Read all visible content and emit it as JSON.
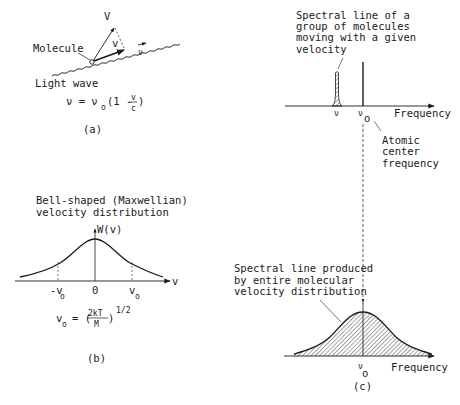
{
  "panel_a": {
    "caption": "(a)",
    "labels": {
      "velocity_vector": "V",
      "velocity_component": "v",
      "wave_frequency": "ν",
      "molecule": "Molecule",
      "light_wave": "Light wave"
    },
    "formula": {
      "lhs": "ν = ν",
      "sub": "o",
      "paren_open": "(1 - ",
      "num": "v",
      "den": "c",
      "paren_close": ")"
    }
  },
  "panel_b": {
    "caption": "(b)",
    "title_line1": "Bell-shaped (Maxwellian)",
    "title_line2": "velocity distribution",
    "y_axis_label": "W(v)",
    "x_axis_label": "v",
    "ticks": {
      "neg": "-v",
      "neg_sub": "o",
      "zero": "0",
      "pos": "v",
      "pos_sub": "o"
    },
    "formula": {
      "lhs": "v",
      "lhs_sub": "o",
      "eq": "= (",
      "num": "2kT",
      "den": "M",
      "close": ")",
      "exp": "1/2"
    }
  },
  "panel_c": {
    "caption": "(c)",
    "top": {
      "annotation_lines": [
        "Spectral line of a",
        "group of molecules",
        "moving with a given",
        "velocity"
      ],
      "tick_nu": "ν",
      "tick_nu0": "ν",
      "tick_nu0_sub": "o",
      "x_axis_label": "Frequency",
      "center_annotation_lines": [
        "Atomic",
        "center",
        "frequency"
      ]
    },
    "bottom": {
      "annotation_lines": [
        "Spectral line produced",
        "by entire molecular",
        "velocity distribution"
      ],
      "tick_nu0": "ν",
      "tick_nu0_sub": "o",
      "x_axis_label": "Frequency"
    }
  },
  "colors": {
    "ink": "#1a1a1a",
    "background": "#ffffff",
    "guide": "#555555"
  }
}
